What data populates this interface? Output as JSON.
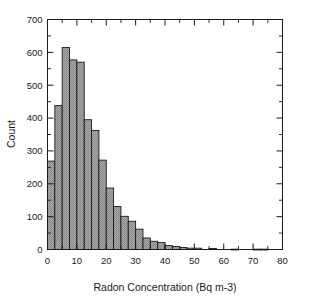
{
  "chart_data": {
    "type": "bar",
    "title": "",
    "subtitle": "",
    "xlabel": "Radon Concentration (Bq m-3)",
    "ylabel": "Count",
    "xlim": [
      0,
      80
    ],
    "ylim": [
      0,
      700
    ],
    "xticks": [
      0,
      10,
      20,
      30,
      40,
      50,
      60,
      70,
      80
    ],
    "yticks": [
      0,
      100,
      200,
      300,
      400,
      500,
      600,
      700
    ],
    "xtick_labels": [
      "0",
      "10",
      "20",
      "30",
      "40",
      "50",
      "60",
      "70",
      "80"
    ],
    "ytick_labels": [
      "0",
      "100",
      "200",
      "300",
      "400",
      "500",
      "600",
      "700"
    ],
    "grid": false,
    "legend": null,
    "bin_width": 2.5,
    "bin_edges": [
      0,
      2.5,
      5,
      7.5,
      10,
      12.5,
      15,
      17.5,
      20,
      22.5,
      25,
      27.5,
      30,
      32.5,
      35,
      37.5,
      40,
      42.5,
      45,
      47.5,
      50,
      52.5,
      55,
      57.5,
      60,
      62.5,
      65,
      67.5,
      70,
      72.5,
      75
    ],
    "categories": [
      "0-2.5",
      "2.5-5",
      "5-7.5",
      "7.5-10",
      "10-12.5",
      "12.5-15",
      "15-17.5",
      "17.5-20",
      "20-22.5",
      "22.5-25",
      "25-27.5",
      "27.5-30",
      "30-32.5",
      "32.5-35",
      "35-37.5",
      "37.5-40",
      "40-42.5",
      "42.5-45",
      "45-47.5",
      "47.5-50",
      "50-52.5",
      "52.5-55",
      "55-57.5",
      "57.5-60",
      "60-62.5",
      "62.5-65",
      "65-67.5",
      "67.5-70",
      "70-72.5",
      "72.5-75"
    ],
    "values": [
      269,
      438,
      615,
      577,
      570,
      395,
      362,
      272,
      187,
      131,
      101,
      86,
      62,
      35,
      25,
      21,
      12,
      9,
      6,
      4,
      4,
      0,
      3,
      0,
      0,
      1,
      0,
      0,
      1,
      1
    ],
    "bar_fill": "#9a9a9a",
    "bar_edge": "#1a1a1a"
  },
  "style": {
    "background": "#ffffff",
    "axis_color": "#1a1a1a"
  }
}
